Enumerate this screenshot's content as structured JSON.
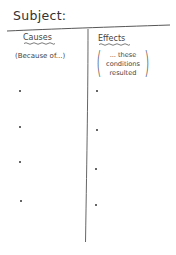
{
  "worksheet": {
    "subject_label": "Subject:",
    "causes": {
      "heading": "Causes",
      "prompt": "(Because of...)",
      "bullets": [
        "",
        "",
        "",
        ""
      ]
    },
    "effects": {
      "heading": "Effects",
      "prompt_lines": [
        "... these",
        "conditions",
        "resulted"
      ],
      "bullets": [
        "",
        "",
        "",
        ""
      ]
    },
    "colors": {
      "ink": "#3a3a3a",
      "background": "#ffffff"
    }
  }
}
